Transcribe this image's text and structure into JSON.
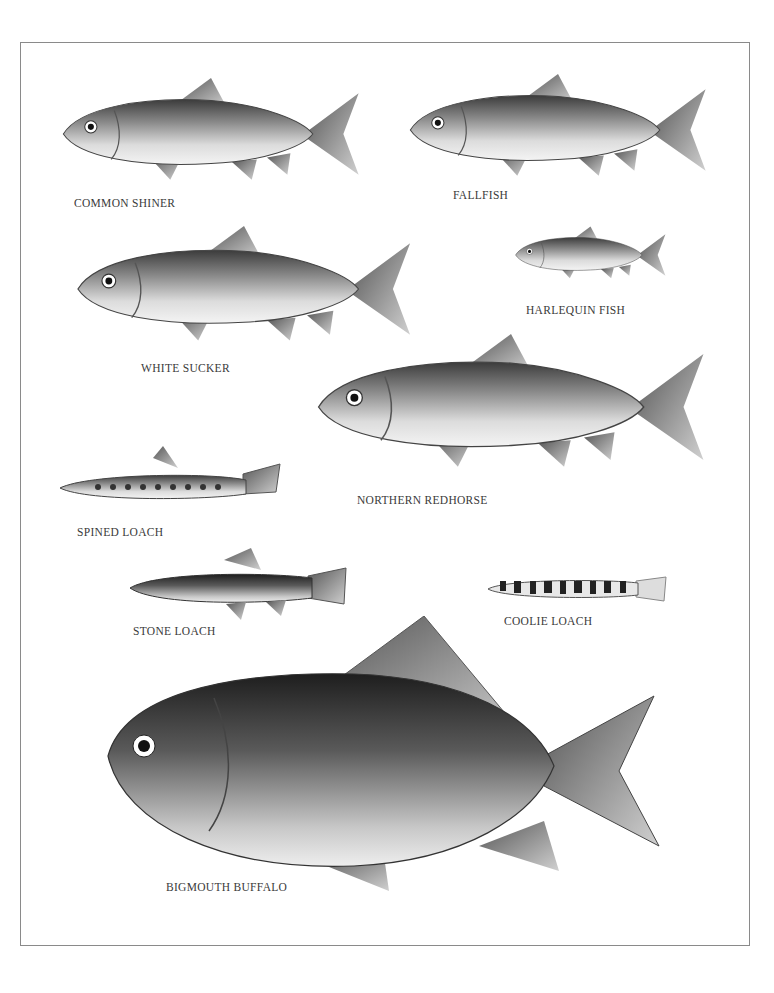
{
  "plate": {
    "species": [
      {
        "id": "common-shiner",
        "label": "COMMON SHINER"
      },
      {
        "id": "fallfish",
        "label": "FALLFISH"
      },
      {
        "id": "white-sucker",
        "label": "WHITE SUCKER"
      },
      {
        "id": "harlequin-fish",
        "label": "HARLEQUIN FISH"
      },
      {
        "id": "northern-redhorse",
        "label": "NORTHERN REDHORSE"
      },
      {
        "id": "spined-loach",
        "label": "SPINED LOACH"
      },
      {
        "id": "stone-loach",
        "label": "STONE LOACH"
      },
      {
        "id": "coolie-loach",
        "label": "COOLIE LOACH"
      },
      {
        "id": "bigmouth-buffalo",
        "label": "BIGMOUTH BUFFALO"
      }
    ]
  }
}
